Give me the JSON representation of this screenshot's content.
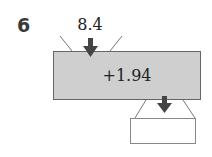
{
  "question": {
    "number": "6"
  },
  "function_machine": {
    "input": "8.4",
    "operation": "+1.94",
    "output": ""
  },
  "colors": {
    "machine_fill": "#cfcfcf",
    "arrow": "#444444",
    "lines": "#777777"
  }
}
